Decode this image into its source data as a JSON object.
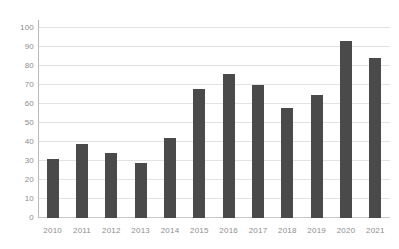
{
  "chart_data": {
    "type": "bar",
    "title": "",
    "xlabel": "",
    "ylabel": "",
    "categories": [
      "2010",
      "2011",
      "2012",
      "2013",
      "2014",
      "2015",
      "2016",
      "2017",
      "2018",
      "2019",
      "2020",
      "2021"
    ],
    "values": [
      31,
      39,
      34,
      29,
      42,
      68,
      76,
      70,
      58,
      65,
      93,
      84
    ],
    "ylim": [
      0,
      100
    ],
    "y_ticks": [
      0,
      10,
      20,
      30,
      40,
      50,
      60,
      70,
      80,
      90,
      100
    ],
    "y_tick_labels": [
      "0",
      "10",
      "20",
      "30",
      "40",
      "50",
      "60",
      "70",
      "80",
      "90",
      "100"
    ],
    "grid": true,
    "legend": false,
    "legend_position": "none",
    "series": [
      {
        "name": "",
        "values": [
          31,
          39,
          34,
          29,
          42,
          68,
          76,
          70,
          58,
          65,
          93,
          84
        ]
      }
    ],
    "colors": {
      "bar": "#4a4a4a",
      "gridline": "#e2e2e2",
      "axis": "#b9b9b9",
      "baseline": "#c9c9c9",
      "tick_label": "#8d8d8d",
      "background": "#ffffff"
    }
  }
}
